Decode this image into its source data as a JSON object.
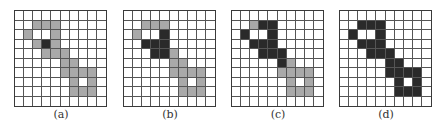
{
  "figure": {
    "grid_size": 10,
    "legend": {
      "w": "empty cell",
      "g": "gray cell",
      "b": "black cell"
    },
    "colors": {
      "white": "#ffffff",
      "gray": "#a9a9a9",
      "black": "#2a2a2a"
    },
    "panels": [
      {
        "label": "(a)",
        "rows": [
          "wwwwwwwwww",
          "wwgggwwwww",
          "wgwwgwwwww",
          "wwgbgwwwww",
          "wwwgggwwww",
          "wwwwwggwww",
          "wwwwwggggw",
          "wwwwwwgwgw",
          "wwwwwwgggw",
          "wwwwwwwwww"
        ]
      },
      {
        "label": "(b)",
        "rows": [
          "wwwwwwwwww",
          "wwgggwwwww",
          "wgwwbwwwww",
          "wwbbbwwwww",
          "wwwbbgwwww",
          "wwwwwggwww",
          "wwwwwggggw",
          "wwwwwwgwgw",
          "wwwwwwgggw",
          "wwwwwwwwww"
        ]
      },
      {
        "label": "(c)",
        "rows": [
          "wwwwwwwwww",
          "wwgbbwwwww",
          "wbwwbwwwww",
          "wwbbbwwwww",
          "wwwbbbwwww",
          "wwwwwbgwww",
          "wwwwwggggw",
          "wwwwwwgwgw",
          "wwwwwwgggw",
          "wwwwwwwwww"
        ]
      },
      {
        "label": "(d)",
        "rows": [
          "wwwwwwwwww",
          "wwbbbwwwww",
          "wbwwbwwwww",
          "wwbbbwwwww",
          "wwwbbbwwww",
          "wwwwwbbwww",
          "wwwwwbbbbw",
          "wwwwwwbwbw",
          "wwwwwwbbbw",
          "wwwwwwwwww"
        ]
      }
    ]
  }
}
